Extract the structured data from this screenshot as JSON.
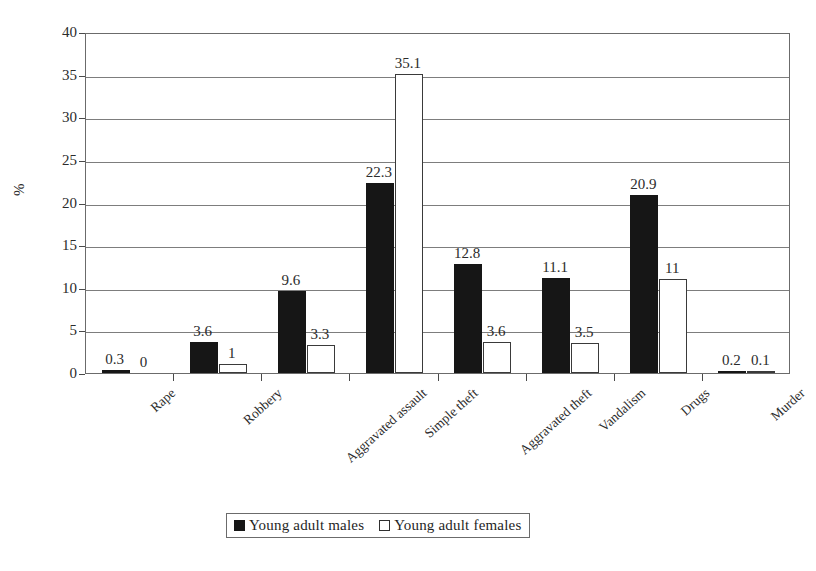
{
  "chart_data": {
    "type": "bar",
    "title": "",
    "xlabel": "",
    "ylabel": "%",
    "ylim": [
      0,
      40
    ],
    "ytick_values": [
      0,
      5,
      10,
      15,
      20,
      25,
      30,
      35,
      40
    ],
    "ytick_labels": [
      "0",
      "5",
      "10",
      "15",
      "20",
      "25",
      "30",
      "35",
      "40"
    ],
    "grid": true,
    "legend_position": "bottom-center",
    "categories": [
      "Rape",
      "Robbery",
      "Aggravated assault",
      "Simple theft",
      "Aggravated theft",
      "Vandalism",
      "Drugs",
      "Murder"
    ],
    "series": [
      {
        "name": "Young  adult males",
        "color": "#161616",
        "values": [
          0.3,
          3.6,
          9.6,
          22.3,
          12.8,
          11.1,
          20.9,
          0.2
        ],
        "labels": [
          "0.3",
          "3.6",
          "9.6",
          "22.3",
          "12.8",
          "11.1",
          "20.9",
          "0.2"
        ]
      },
      {
        "name": "Young  adult  females",
        "color": "#ffffff",
        "values": [
          0,
          1,
          3.3,
          35.1,
          3.6,
          3.5,
          11,
          0.1
        ],
        "labels": [
          "0",
          "1",
          "3.3",
          "35.1",
          "3.6",
          "3.5",
          "11",
          "0.1"
        ]
      }
    ]
  },
  "legend": {
    "items": [
      {
        "label": "Young  adult males",
        "swatch": "male"
      },
      {
        "label": "Young  adult  females",
        "swatch": "female"
      }
    ]
  }
}
